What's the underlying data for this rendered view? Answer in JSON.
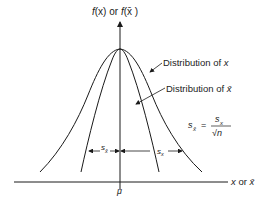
{
  "diagram": {
    "y_axis_label": {
      "part1": "f",
      "x": "(x)",
      "or": " or ",
      "part2": "f",
      "xbar": "(x̄ )"
    },
    "x_axis_label": {
      "x": "x",
      "or": " or ",
      "xbar": "x̄"
    },
    "mu_label": "μ",
    "curves": [
      {
        "name": "Distribution of x",
        "label": "Distribution of ",
        "var": "x",
        "width": "wide"
      },
      {
        "name": "Distribution of x̄",
        "label": "Distribution of ",
        "var": "x̄",
        "width": "narrow"
      }
    ],
    "formula": {
      "lhs": "s",
      "lhs_sub": "x̄",
      "eq": "=",
      "num": "s",
      "num_sub": "x",
      "den": "√n"
    },
    "spread_labels": {
      "narrow": "s",
      "narrow_sub": "x̄",
      "wide": "s",
      "wide_sub": "x"
    },
    "colors": {
      "line": "#1a1a1a",
      "background": "#ffffff"
    }
  }
}
